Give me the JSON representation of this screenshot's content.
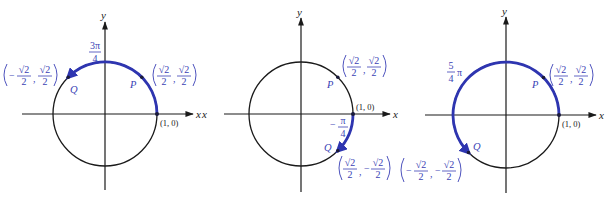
{
  "figure": {
    "colors": {
      "axis": "#1a1a1a",
      "arc": "#2e35b0",
      "label_blue": "#3a3fb5"
    },
    "common": {
      "x_axis_label": "x",
      "y_axis_label": "y",
      "start_point_label": "(1, 0)",
      "point_p_label": "P",
      "point_q_label": "Q",
      "p_coord": {
        "x_num": "√2",
        "x_den": "2",
        "y_num": "√2",
        "y_den": "2",
        "text": "(√2/2, √2/2)"
      }
    },
    "panels": [
      {
        "id": "panel-1",
        "angle_label": {
          "num": "3π",
          "den": "4",
          "text": "3π/4"
        },
        "direction": "counterclockwise",
        "q_coord": {
          "x_sign": "−",
          "x_num": "√2",
          "x_den": "2",
          "y_sign": "",
          "y_num": "√2",
          "y_den": "2",
          "text": "(−√2/2, √2/2)"
        }
      },
      {
        "id": "panel-2",
        "angle_label": {
          "sign": "−",
          "num": "π",
          "den": "4",
          "text": "−π/4"
        },
        "direction": "clockwise",
        "left_x_label": "x",
        "q_coord": {
          "x_sign": "",
          "x_num": "√2",
          "x_den": "2",
          "y_sign": "−",
          "y_num": "√2",
          "y_den": "2",
          "text": "(√2/2, −√2/2)"
        }
      },
      {
        "id": "panel-3",
        "angle_label": {
          "num": "5",
          "den": "4",
          "suffix": "π",
          "text": "5/4 π"
        },
        "direction": "counterclockwise",
        "q_coord": {
          "x_sign": "−",
          "x_num": "√2",
          "x_den": "2",
          "y_sign": "−",
          "y_num": "√2",
          "y_den": "2",
          "text": "(−√2/2, −√2/2)"
        }
      }
    ]
  }
}
